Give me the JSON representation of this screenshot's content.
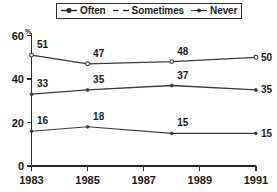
{
  "chart_data": {
    "type": "line",
    "title": "",
    "xlabel": "",
    "ylabel": "",
    "x": [
      1983,
      1985,
      1988,
      1991
    ],
    "xtick_labels": [
      "1983",
      "1985",
      "1987",
      "1989",
      "1991"
    ],
    "xtick_values": [
      1983,
      1985,
      1987,
      1989,
      1991
    ],
    "xlim": [
      1983,
      1991
    ],
    "ytick_labels": [
      "0",
      "20",
      "40",
      "60"
    ],
    "ytick_values": [
      0,
      20,
      40,
      60
    ],
    "ylim": [
      0,
      60
    ],
    "y_unit": "%",
    "grid": false,
    "legend_position": "top-center",
    "series": [
      {
        "name": "Often",
        "style": "solid-circle",
        "values": [
          51,
          47,
          48,
          50
        ],
        "labels": [
          "51",
          "47",
          "48",
          "50"
        ]
      },
      {
        "name": "Sometimes",
        "style": "dashed",
        "values": [
          33,
          35,
          37,
          35
        ],
        "labels": [
          "33",
          "35",
          "37",
          "35"
        ]
      },
      {
        "name": "Never",
        "style": "thin-dot",
        "values": [
          16,
          18,
          15,
          15
        ],
        "labels": [
          "16",
          "18",
          "15",
          "15"
        ]
      }
    ],
    "colors": {
      "line": "#3a3a3a",
      "axis": "#2b2b2b",
      "text": "#1a1a1a",
      "background": "#ffffff"
    }
  },
  "legend": {
    "items": [
      {
        "label": "Often",
        "marker": "solid-line-circle-marker-icon"
      },
      {
        "label": "Sometimes",
        "marker": "dashed-line-icon"
      },
      {
        "label": "Never",
        "marker": "thin-line-dot-marker-icon"
      }
    ]
  },
  "axes": {
    "y_unit": "%",
    "y_ticks": [
      "60",
      "40",
      "20",
      "0"
    ],
    "x_ticks": [
      "1983",
      "1985",
      "1987",
      "1989",
      "1991"
    ]
  },
  "values": {
    "often": [
      "51",
      "47",
      "48",
      "50"
    ],
    "sometimes": [
      "33",
      "35",
      "37",
      "35"
    ],
    "never": [
      "16",
      "18",
      "15",
      "15"
    ]
  }
}
